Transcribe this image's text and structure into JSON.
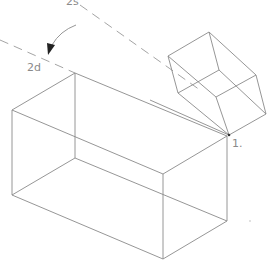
{
  "diagram": {
    "labels": {
      "angle_top": "2s",
      "angle_bottom": "2d",
      "point_1": "1."
    },
    "icons": {
      "rotation_arrow": "curved-arrow-icon"
    },
    "colors": {
      "line": "#8a8a8a",
      "dashed": "#9a9a9a",
      "background": "#ffffff"
    }
  }
}
